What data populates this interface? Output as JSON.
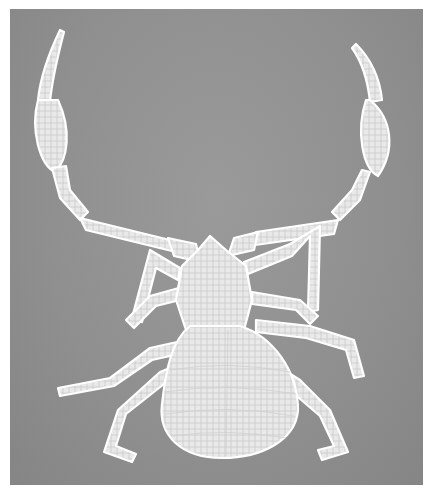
{
  "image": {
    "subject": "pseudoscorpion",
    "style": "grayscale micrograph, white specimen on gray background",
    "colors": {
      "background": "#8f8f8f",
      "specimen": "#f2f2f2",
      "outline": "#ffffff",
      "shadow": "#3c3c3c",
      "margin": "#ffffff"
    }
  }
}
